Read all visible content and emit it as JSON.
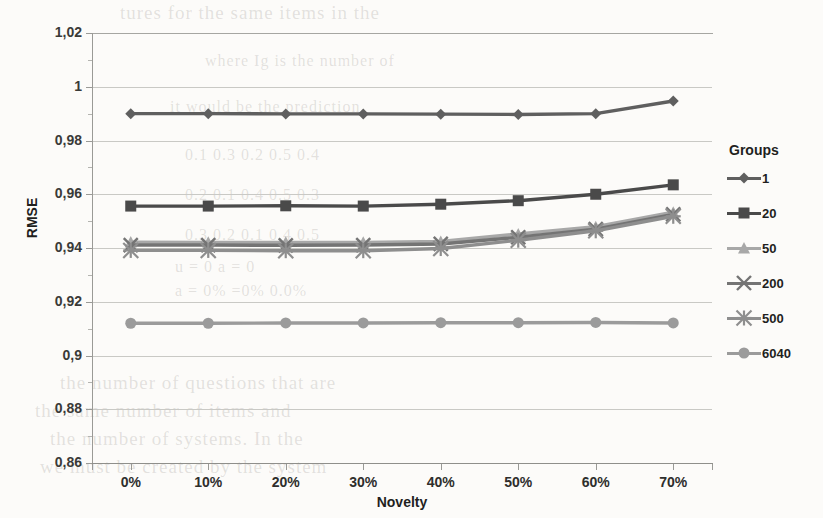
{
  "chart_data": {
    "type": "line",
    "title": "",
    "xlabel": "Novelty",
    "ylabel": "RMSE",
    "legend_title": "Groups",
    "legend_position": "right",
    "grid": true,
    "x": [
      "0%",
      "10%",
      "20%",
      "30%",
      "40%",
      "50%",
      "60%",
      "70%"
    ],
    "x_numeric": [
      0,
      10,
      20,
      30,
      40,
      50,
      60,
      70
    ],
    "xlim": [
      -5,
      75
    ],
    "ylim": [
      0.86,
      1.02
    ],
    "ytick_labels": [
      "1,02",
      "1",
      "0,98",
      "0,96",
      "0,94",
      "0,92",
      "0,9",
      "0,88",
      "0,86"
    ],
    "ytick_values": [
      1.02,
      1.0,
      0.98,
      0.96,
      0.94,
      0.92,
      0.9,
      0.88,
      0.86
    ],
    "decimal_separator": ",",
    "series": [
      {
        "name": "1",
        "marker": "diamond",
        "color": "#5f5f5f",
        "values": [
          0.99,
          0.99,
          0.9899,
          0.9899,
          0.9898,
          0.9897,
          0.99,
          0.9947
        ]
      },
      {
        "name": "20",
        "marker": "square",
        "color": "#4a4a4a",
        "values": [
          0.9556,
          0.9556,
          0.9557,
          0.9556,
          0.9563,
          0.9576,
          0.96,
          0.9635
        ]
      },
      {
        "name": "50",
        "marker": "triangle",
        "color": "#a8a8a8",
        "values": [
          0.9422,
          0.9421,
          0.9421,
          0.9421,
          0.9424,
          0.9452,
          0.9479,
          0.9533
        ]
      },
      {
        "name": "200",
        "marker": "cross",
        "color": "#747474",
        "values": [
          0.9411,
          0.9411,
          0.941,
          0.9411,
          0.9415,
          0.944,
          0.947,
          0.9525
        ]
      },
      {
        "name": "500",
        "marker": "star",
        "color": "#8e8e8e",
        "values": [
          0.9391,
          0.9391,
          0.939,
          0.939,
          0.9398,
          0.9429,
          0.9464,
          0.9518
        ]
      },
      {
        "name": "6040",
        "marker": "circle",
        "color": "#9b9b9b",
        "values": [
          0.912,
          0.912,
          0.9121,
          0.9121,
          0.9122,
          0.9122,
          0.9123,
          0.9121
        ]
      }
    ]
  },
  "background_text": [
    "tures for the same items in the",
    "where Ig is the number of",
    "it would be the prediction",
    "0.1   0.3   0.2   0.5   0.4",
    "0.2   0.1   0.4   0.5   0.3",
    "0.3   0.2   0.1   0.4   0.5",
    "u = 0     a = 0",
    "a = 0%     =0%      0.0%",
    "the number of questions that are",
    "the same number of items and",
    "the number of systems. In the",
    "we must be created by the system"
  ]
}
